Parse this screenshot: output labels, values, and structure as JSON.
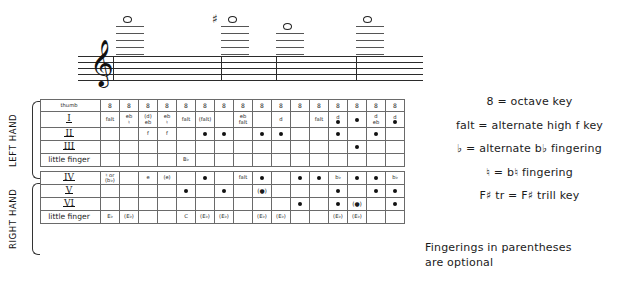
{
  "notation": {
    "clef_glyph": "𝄞",
    "clef_name": "treble-clef",
    "notes": [
      {
        "name": "note-1",
        "accidental": "",
        "ledger_lines": 5,
        "x": 38
      },
      {
        "name": "note-2",
        "accidental": "♯",
        "ledger_lines": 5,
        "x": 143
      },
      {
        "name": "note-3",
        "accidental": "",
        "ledger_lines": 4,
        "x": 198
      },
      {
        "name": "note-4",
        "accidental": "",
        "ledger_lines": 5,
        "x": 278
      }
    ],
    "barlines_x": [
      35,
      143,
      198,
      278
    ]
  },
  "chart": {
    "hands": [
      {
        "name": "LEFT HAND",
        "label_lines": [
          "LEFT",
          "HAND"
        ]
      },
      {
        "name": "RIGHT HAND",
        "label_lines": [
          "RIGHT",
          "HAND"
        ]
      }
    ],
    "column_count": 16,
    "rows": [
      {
        "id": "thumb",
        "label": "thumb",
        "label_style": "plain",
        "hand": "left",
        "cells": [
          "8",
          "8",
          "8",
          "8",
          "8",
          "8",
          "8",
          "8",
          "8",
          "8",
          "8",
          "8",
          "8",
          "8",
          "8",
          "8"
        ]
      },
      {
        "id": "I",
        "label": "I",
        "label_style": "roman",
        "hand": "left",
        "cells": [
          {
            "text": [
              "falt"
            ]
          },
          {
            "text": [
              "eb",
              "♮"
            ]
          },
          {
            "text": [
              "(d)",
              "eb"
            ]
          },
          {
            "text": [
              "eb",
              "♮"
            ]
          },
          {
            "text": [
              "falt"
            ]
          },
          {
            "text": [
              "(falt)"
            ]
          },
          {
            "text": []
          },
          {
            "text": [
              "eb",
              "falt"
            ]
          },
          {
            "text": []
          },
          {
            "text": [
              "d"
            ]
          },
          {
            "text": []
          },
          {
            "text": [
              "falt"
            ]
          },
          {
            "text": [
              "d"
            ],
            "dot": true
          },
          {
            "text": [],
            "dot": true
          },
          {
            "text": [
              "d",
              "eb"
            ]
          },
          {
            "text": [
              "d"
            ],
            "dot": true
          }
        ]
      },
      {
        "id": "II",
        "label": "II",
        "label_style": "roman",
        "hand": "left",
        "cells": [
          {
            "text": []
          },
          {
            "text": []
          },
          {
            "text": [
              "f"
            ]
          },
          {
            "text": [
              "f"
            ]
          },
          {
            "text": []
          },
          {
            "text": [],
            "dot": true
          },
          {
            "text": [],
            "dot": true
          },
          {
            "text": []
          },
          {
            "text": [],
            "dot": true
          },
          {
            "text": [],
            "dot": true
          },
          {
            "text": []
          },
          {
            "text": []
          },
          {
            "text": [],
            "dot": true
          },
          {
            "text": []
          },
          {
            "text": [],
            "dot": true
          },
          {
            "text": []
          }
        ]
      },
      {
        "id": "III",
        "label": "III",
        "label_style": "roman",
        "hand": "left",
        "cells": [
          {
            "text": []
          },
          {
            "text": []
          },
          {
            "text": []
          },
          {
            "text": []
          },
          {
            "text": []
          },
          {
            "text": []
          },
          {
            "text": []
          },
          {
            "text": []
          },
          {
            "text": []
          },
          {
            "text": []
          },
          {
            "text": []
          },
          {
            "text": []
          },
          {
            "text": []
          },
          {
            "text": [],
            "dot": true
          },
          {
            "text": []
          },
          {
            "text": []
          }
        ]
      },
      {
        "id": "little-finger-left",
        "label": "little finger",
        "label_style": "small",
        "hand": "left",
        "cells": [
          {
            "text": []
          },
          {
            "text": []
          },
          {
            "text": []
          },
          {
            "text": []
          },
          {
            "text": [
              "B♭"
            ]
          },
          {
            "text": []
          },
          {
            "text": []
          },
          {
            "text": []
          },
          {
            "text": []
          },
          {
            "text": []
          },
          {
            "text": []
          },
          {
            "text": []
          },
          {
            "text": []
          },
          {
            "text": []
          },
          {
            "text": []
          },
          {
            "text": []
          }
        ]
      },
      {
        "id": "IV",
        "label": "IV",
        "label_style": "roman",
        "hand": "right",
        "cells": [
          {
            "text": [
              "♮ or",
              "(b♭)"
            ]
          },
          {
            "text": []
          },
          {
            "text": [
              "e"
            ]
          },
          {
            "text": [
              "(e)"
            ]
          },
          {
            "text": []
          },
          {
            "text": [],
            "dot": true
          },
          {
            "text": []
          },
          {
            "text": [
              "falt"
            ]
          },
          {
            "text": [],
            "dot": true
          },
          {
            "text": []
          },
          {
            "text": [],
            "dot": true
          },
          {
            "text": [],
            "dot": true
          },
          {
            "text": [
              "b♭"
            ]
          },
          {
            "text": [],
            "dot": true
          },
          {
            "text": [],
            "dot": true
          },
          {
            "text": [
              "b♭"
            ]
          }
        ]
      },
      {
        "id": "V",
        "label": "V",
        "label_style": "roman",
        "hand": "right",
        "cells": [
          {
            "text": []
          },
          {
            "text": []
          },
          {
            "text": []
          },
          {
            "text": []
          },
          {
            "text": [],
            "dot": true
          },
          {
            "text": []
          },
          {
            "text": [],
            "dot": true
          },
          {
            "text": []
          },
          {
            "text": [
              "(●)"
            ],
            "paren_dot": true
          },
          {
            "text": []
          },
          {
            "text": []
          },
          {
            "text": []
          },
          {
            "text": [],
            "dot": true
          },
          {
            "text": []
          },
          {
            "text": [],
            "dot": true
          },
          {
            "text": [],
            "dot": true
          }
        ]
      },
      {
        "id": "VI",
        "label": "VI",
        "label_style": "roman",
        "hand": "right",
        "cells": [
          {
            "text": []
          },
          {
            "text": []
          },
          {
            "text": []
          },
          {
            "text": []
          },
          {
            "text": []
          },
          {
            "text": []
          },
          {
            "text": []
          },
          {
            "text": []
          },
          {
            "text": []
          },
          {
            "text": []
          },
          {
            "text": [],
            "dot": true
          },
          {
            "text": []
          },
          {
            "text": [],
            "dot": true
          },
          {
            "text": [
              "(●)"
            ],
            "paren_dot": true
          },
          {
            "text": []
          },
          {
            "text": [],
            "dot": true
          }
        ]
      },
      {
        "id": "little-finger-right",
        "label": "little finger",
        "label_style": "small",
        "hand": "right",
        "cells": [
          {
            "text": [
              "E♭"
            ]
          },
          {
            "text": [
              "(E♭)"
            ]
          },
          {
            "text": []
          },
          {
            "text": []
          },
          {
            "text": [
              "C"
            ]
          },
          {
            "text": [
              "(E♭)"
            ]
          },
          {
            "text": [
              "(E♭)"
            ]
          },
          {
            "text": []
          },
          {
            "text": [
              "(E♭)"
            ]
          },
          {
            "text": [
              "(E♭)"
            ]
          },
          {
            "text": []
          },
          {
            "text": []
          },
          {
            "text": [
              "(E♭)"
            ]
          },
          {
            "text": [
              "(E♭)"
            ]
          },
          {
            "text": []
          },
          {
            "text": []
          }
        ]
      }
    ]
  },
  "legend": {
    "lines": [
      "8 = octave key",
      "falt = alternate high f key",
      "♭ = alternate b♭ fingering",
      "♮ = b♮ fingering",
      "F♯ tr = F♯ trill key"
    ]
  },
  "footnote": {
    "line1": "Fingerings in parentheses",
    "line2": "are optional"
  }
}
